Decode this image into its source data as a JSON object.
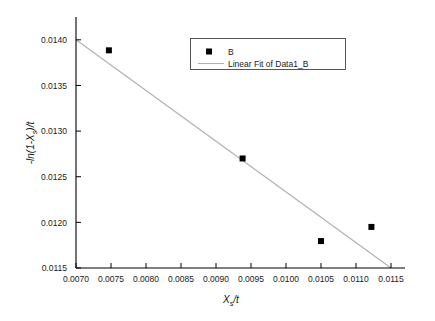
{
  "chart_data": {
    "type": "scatter",
    "title": "",
    "xlabel": "X_s/t",
    "ylabel": "-ln(1-X_s)/t",
    "xlim": [
      0.007,
      0.0117
    ],
    "ylim": [
      0.0115,
      0.01425
    ],
    "xticks": [
      "0.0070",
      "0.0075",
      "0.0080",
      "0.0085",
      "0.0090",
      "0.0095",
      "0.0100",
      "0.0105",
      "0.0110",
      "0.0115"
    ],
    "xtick_values": [
      0.007,
      0.0075,
      0.008,
      0.0085,
      0.009,
      0.0095,
      0.01,
      0.0105,
      0.011,
      0.0115
    ],
    "yticks": [
      "0.0115",
      "0.0120",
      "0.0125",
      "0.0130",
      "0.0135",
      "0.0140"
    ],
    "ytick_values": [
      0.0115,
      0.012,
      0.0125,
      0.013,
      0.0135,
      0.014
    ],
    "grid": false,
    "legend_position": "top-right",
    "series": [
      {
        "name": "B",
        "type": "scatter",
        "marker": "square",
        "color": "#000000",
        "points": [
          {
            "x": 0.00747,
            "y": 0.013885
          },
          {
            "x": 0.00938,
            "y": 0.0127
          },
          {
            "x": 0.0105,
            "y": 0.011795
          },
          {
            "x": 0.01122,
            "y": 0.01195
          }
        ]
      },
      {
        "name": "Linear Fit of Data1_B",
        "type": "line",
        "color": "#b0b0b0",
        "endpoints": [
          {
            "x": 0.007,
            "y": 0.014
          },
          {
            "x": 0.0115,
            "y": 0.0115
          }
        ]
      }
    ]
  },
  "axis_labels": {
    "x_main": "X",
    "x_sub": "s",
    "x_rest": "/t",
    "y_pre": "-ln(1-X",
    "y_sub": "s",
    "y_post": ")/t"
  },
  "legend": {
    "entries": [
      {
        "label": "B",
        "marker": "square"
      },
      {
        "label": "Linear Fit of Data1_B",
        "marker": "line"
      }
    ]
  },
  "colors": {
    "axis": "#000000",
    "marker": "#000000",
    "fit_line": "#b0b0b0",
    "legend_border": "#444444",
    "background": "#ffffff"
  }
}
